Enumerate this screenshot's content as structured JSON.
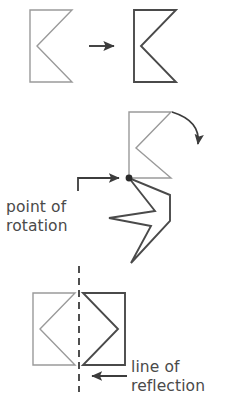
{
  "figure": {
    "background_color": "#ffffff",
    "colors": {
      "preimage_stroke": "#9a9a9a",
      "image_stroke": "#4a4a4a",
      "arrow": "#3c3c3c",
      "text": "#4a4a4a",
      "dashed_line": "#3c3c3c",
      "pivot_dot": "#2b2b2b"
    },
    "stroke_widths": {
      "preimage": 1.4,
      "image": 1.9,
      "arrow": 1.9,
      "dashed_line": 1.8
    }
  },
  "panels": [
    {
      "id": "translation",
      "name": "translation-panel",
      "preimage": {
        "name": "translation-preimage-shape",
        "points": "30,10 72,10 37,46 72,82 30,82",
        "color_role": "preimage_stroke"
      },
      "image": {
        "name": "translation-image-shape",
        "points": "134,10 176,10 141,46 176,82 134,82",
        "color_role": "image_stroke"
      },
      "arrow": {
        "name": "translation-arrow",
        "direction": "right",
        "x1": 89,
        "y1": 46,
        "x2": 117,
        "y2": 46
      }
    },
    {
      "id": "rotation",
      "name": "rotation-panel",
      "preimage": {
        "name": "rotation-preimage-shape",
        "points": "129,112 171,112 136,148 171,178 129,178",
        "color_role": "preimage_stroke"
      },
      "image": {
        "name": "rotation-image-shape",
        "points": "129,178 155,211 109,218 151,226 131,263 170,221 170,195",
        "color_role": "image_stroke"
      },
      "pivot": {
        "name": "point-of-rotation-dot",
        "cx": 129,
        "cy": 178,
        "r": 3.4
      },
      "curved_arrow": {
        "name": "rotation-curved-arrow",
        "path": "M 172,112 Q 200,122 199,147",
        "arrowhead_at": [
          199,
          150
        ]
      },
      "callout_arrow": {
        "name": "point-of-rotation-callout-arrow",
        "path": "M 78,190 L 78,178 L 122,178",
        "arrowhead_at": [
          124,
          178
        ]
      },
      "label": {
        "name": "point-of-rotation-label",
        "lines": [
          "point of",
          "rotation"
        ],
        "x": 6,
        "y": 212,
        "line_height": 19
      }
    },
    {
      "id": "reflection",
      "name": "reflection-panel",
      "preimage": {
        "name": "reflection-preimage-shape",
        "points": "33,293 75,293 40,329 75,365 33,365",
        "color_role": "preimage_stroke"
      },
      "image": {
        "name": "reflection-image-shape",
        "points": "125,293 83,293 118,329 83,365 125,365",
        "color_role": "image_stroke"
      },
      "mirror_line": {
        "name": "line-of-reflection-dashed-line",
        "x": 79,
        "y1": 266,
        "y2": 392,
        "dash": "7,5"
      },
      "callout_arrow": {
        "name": "line-of-reflection-callout-arrow",
        "path": "M 127,376 L 90,376",
        "arrowhead_at": [
          87,
          376
        ]
      },
      "label": {
        "name": "line-of-reflection-label",
        "lines": [
          "line of",
          "reflection"
        ],
        "x": 131,
        "y": 372,
        "line_height": 19
      }
    }
  ]
}
